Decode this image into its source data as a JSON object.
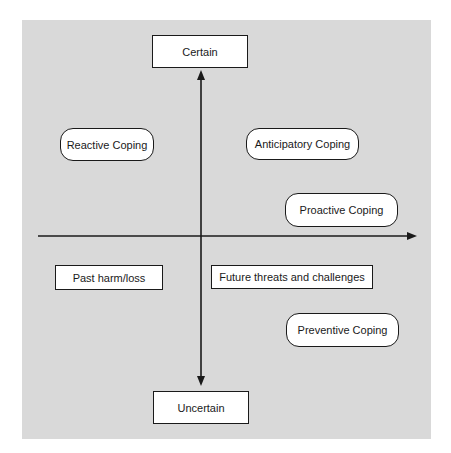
{
  "diagram": {
    "vertical_axis": {
      "top_label": "Certain",
      "bottom_label": "Uncertain"
    },
    "horizontal_axis": {
      "left_label": "Past harm/loss",
      "right_label": "Future threats and challenges"
    },
    "coping_types": {
      "reactive": "Reactive Coping",
      "anticipatory": "Anticipatory Coping",
      "proactive": "Proactive Coping",
      "preventive": "Preventive Coping"
    },
    "colors": {
      "panel": "#d9d9d9",
      "box_fill": "#ffffff",
      "stroke": "#1a1a1a"
    }
  }
}
